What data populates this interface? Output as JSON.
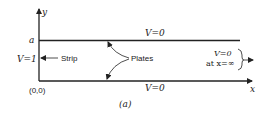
{
  "figure": {
    "caption": "(a)",
    "colors": {
      "ink": "#222222",
      "background": "#ffffff"
    }
  },
  "axes": {
    "y_label": "y",
    "x_label": "x",
    "origin_label": "(0,0)",
    "height_label": "a"
  },
  "labels": {
    "top_plate_potential": "V=0",
    "bottom_plate_potential": "V=0",
    "strip_potential": "V=1",
    "strip": "Strip",
    "plates": "Plates",
    "infinity_potential": "V=0",
    "infinity_condition": "at x=∞"
  }
}
